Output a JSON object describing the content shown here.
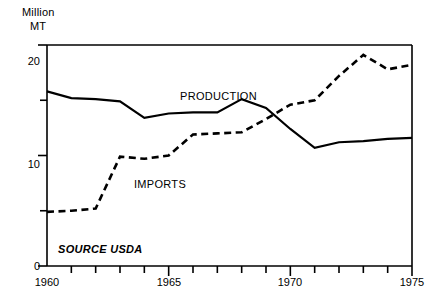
{
  "chart_data": {
    "type": "line",
    "title": "",
    "xlabel": "",
    "ylabel": "Million MT",
    "ylabel_lines": [
      "Million",
      "MT"
    ],
    "xlim": [
      1960,
      1975
    ],
    "ylim": [
      0,
      20
    ],
    "ytick_labels": [
      "0",
      "10",
      "20"
    ],
    "ytick_values": [
      0,
      10,
      20
    ],
    "yminor_values": [
      5,
      15
    ],
    "xtick_labels": [
      "1960",
      "1965",
      "1970",
      "1975"
    ],
    "xtick_values": [
      1960,
      1965,
      1970,
      1975
    ],
    "xtick_all": [
      1960,
      1961,
      1962,
      1963,
      1964,
      1965,
      1966,
      1967,
      1968,
      1969,
      1970,
      1971,
      1972,
      1973,
      1974,
      1975
    ],
    "grid": false,
    "legend_position": "inline-annotations",
    "annotations": [
      {
        "text": "PRODUCTION",
        "x": 1967,
        "y": 16.2
      },
      {
        "text": "IMPORTS",
        "x": 1963.6,
        "y": 8.7
      },
      {
        "text": "SOURCE USDA",
        "x": 1960.5,
        "y": 2.4
      }
    ],
    "x": [
      1960,
      1961,
      1962,
      1963,
      1964,
      1965,
      1966,
      1967,
      1968,
      1969,
      1970,
      1971,
      1972,
      1973,
      1974,
      1975
    ],
    "series": [
      {
        "name": "PRODUCTION",
        "style": "solid",
        "color": "#000000",
        "values": [
          15.8,
          15.2,
          15.1,
          14.9,
          13.4,
          13.8,
          13.9,
          13.9,
          15.1,
          14.3,
          12.4,
          10.7,
          11.2,
          11.3,
          11.5,
          11.6
        ]
      },
      {
        "name": "IMPORTS",
        "style": "dashed",
        "color": "#000000",
        "values": [
          4.9,
          5.0,
          5.2,
          9.9,
          9.7,
          10.0,
          11.9,
          12.0,
          12.1,
          13.3,
          14.6,
          15.0,
          17.2,
          19.1,
          17.8,
          18.2
        ]
      }
    ]
  },
  "axis": {
    "unit_line_1": "Million",
    "unit_line_2": "MT",
    "y_labels": {
      "zero": "0",
      "ten": "10",
      "twenty": "20"
    },
    "x_labels": {
      "start": "1960",
      "mid1": "1965",
      "mid2": "1970",
      "end": "1975"
    }
  },
  "labels": {
    "production": "PRODUCTION",
    "imports": "IMPORTS",
    "source": "SOURCE USDA"
  },
  "colors": {
    "line": "#000000",
    "axis": "#000000",
    "background": "#ffffff"
  }
}
